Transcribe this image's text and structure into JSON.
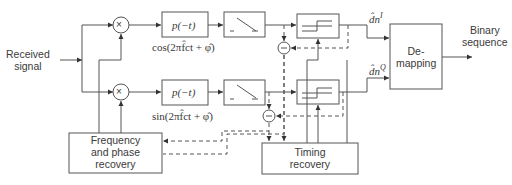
{
  "diagram": {
    "type": "block-diagram",
    "input_label_line1": "Received",
    "input_label_line2": "signal",
    "output_label_line1": "Binary",
    "output_label_line2": "sequence",
    "blocks": {
      "mixer_i": "×",
      "mixer_q": "×",
      "filter_i": "p(−t)",
      "filter_q": "p(−t)",
      "sampler_i": "sampler",
      "sampler_q": "sampler",
      "decision_i": "decision",
      "decision_q": "decision",
      "demapping_line1": "De-",
      "demapping_line2": "mapping",
      "freq_phase_line1": "Frequency",
      "freq_phase_line2": "and phase",
      "freq_phase_line3": "recovery",
      "timing_line1": "Timing",
      "timing_line2": "recovery",
      "subtractor_i": "−",
      "subtractor_q": "−"
    },
    "carrier_i": "cos(2πf̂ct + φ̂)",
    "carrier_q": "sin(2πf̂ct + φ̂)",
    "symbol_i": "d̂n",
    "symbol_i_sup": "I",
    "symbol_q": "d̂n",
    "symbol_q_sup": "Q"
  }
}
